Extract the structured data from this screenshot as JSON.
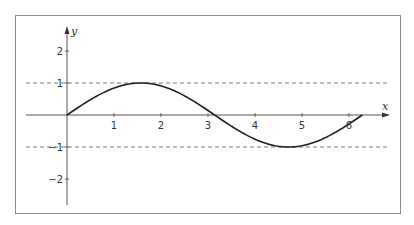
{
  "chart_data": {
    "type": "line",
    "title": "",
    "xlabel": "x",
    "ylabel": "y",
    "xlim": [
      -0.85,
      6.85
    ],
    "ylim": [
      -2.8,
      2.7
    ],
    "x_ticks": [
      1,
      2,
      3,
      4,
      5,
      6
    ],
    "x_tick_labels": [
      "1",
      "2",
      "3",
      "4",
      "5",
      "6"
    ],
    "y_ticks": [
      2,
      1,
      -1,
      -2
    ],
    "y_tick_labels": [
      "2",
      "1",
      "−1",
      "−2"
    ],
    "grid": false,
    "reference_lines": [
      {
        "y": 1,
        "style": "dashed"
      },
      {
        "y": -1,
        "style": "dashed"
      }
    ],
    "series": [
      {
        "name": "y = sin x",
        "x": [
          0,
          0.5,
          1.0,
          1.5708,
          2.0,
          2.5,
          3.1416,
          3.5,
          4.0,
          4.7124,
          5.0,
          5.5,
          6.2832
        ],
        "values": [
          0,
          0.479,
          0.841,
          1.0,
          0.909,
          0.598,
          0.0,
          -0.351,
          -0.757,
          -1.0,
          -0.959,
          -0.706,
          0.0
        ]
      }
    ]
  }
}
